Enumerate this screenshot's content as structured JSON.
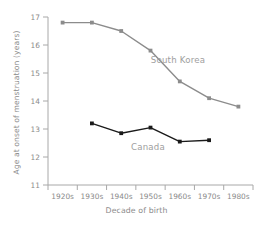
{
  "chart_data": {
    "type": "line",
    "title": "",
    "xlabel": "Decade of birth",
    "ylabel": "Age at onset of menstruation (years)",
    "categories": [
      "1920s",
      "1930s",
      "1940s",
      "1950s",
      "1960s",
      "1970s",
      "1980s"
    ],
    "ylim": [
      11,
      17
    ],
    "yticks": [
      11,
      12,
      13,
      14,
      15,
      16,
      17
    ],
    "ytick_labels": [
      "11",
      "12",
      "13",
      "14",
      "15",
      "16",
      "17"
    ],
    "grid": false,
    "legend": "inline-annotations",
    "series": [
      {
        "name": "South Korea",
        "color": "#8c8c8c",
        "marker": "square",
        "values": [
          16.8,
          16.8,
          16.5,
          15.8,
          14.7,
          14.1,
          13.8
        ]
      },
      {
        "name": "Canada",
        "color": "#1a1a1a",
        "marker": "square",
        "values": [
          null,
          13.2,
          12.85,
          13.05,
          12.55,
          12.6,
          null
        ]
      }
    ],
    "annotations": [
      {
        "text": "South Korea",
        "x": 178,
        "y": 63,
        "color": "#9e9e9e"
      },
      {
        "text": "Canada",
        "x": 148,
        "y": 150,
        "color": "#9e9e9e"
      }
    ]
  },
  "axis": {
    "spine_color": "#a8a8a8",
    "tick_color": "#a8a8a8"
  }
}
